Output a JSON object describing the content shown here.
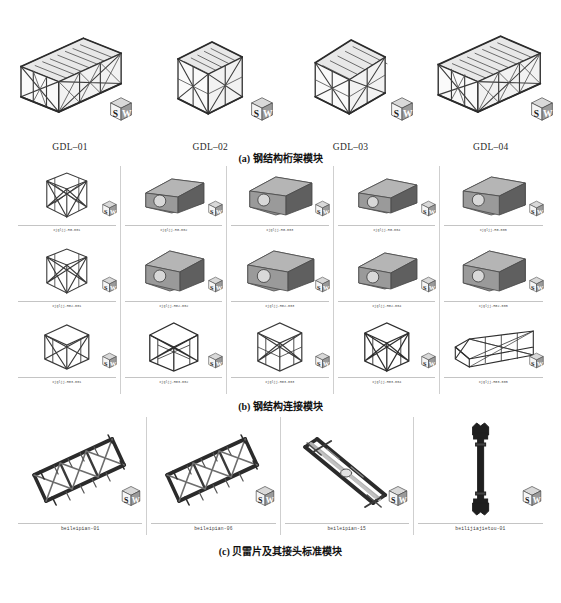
{
  "figure": {
    "sections": [
      {
        "id": "a",
        "caption": "(a) 钢结构桁架模块",
        "items": [
          {
            "label": "GDL–01",
            "shape": "long-truss-box"
          },
          {
            "label": "GDL–02",
            "shape": "square-truss-box"
          },
          {
            "label": "GDL–03",
            "shape": "square-truss-box"
          },
          {
            "label": "GDL–04",
            "shape": "long-truss-box"
          }
        ]
      },
      {
        "id": "b",
        "caption": "(b) 钢结构连接模块",
        "rows": [
          [
            {
              "label": "xjgljj-HG-001",
              "shape": "frame-node"
            },
            {
              "label": "xjgljj-HG-002",
              "shape": "solid-block"
            },
            {
              "label": "xjgljj-HG-003",
              "shape": "solid-block"
            },
            {
              "label": "xjgljj-HG-004",
              "shape": "solid-block"
            },
            {
              "label": "xjgljj-HG-005",
              "shape": "solid-block"
            }
          ],
          [
            {
              "label": "xjgljj-HG2-001",
              "shape": "frame-node"
            },
            {
              "label": "xjgljj-HG2-002",
              "shape": "solid-block"
            },
            {
              "label": "xjgljj-HG2-003",
              "shape": "solid-block"
            },
            {
              "label": "xjgljj-HG2-004",
              "shape": "solid-block"
            },
            {
              "label": "xjgljj-HG2-005",
              "shape": "solid-block"
            }
          ],
          [
            {
              "label": "xjgljj-HG3-001",
              "shape": "frame-cube"
            },
            {
              "label": "xjgljj-HG3-002",
              "shape": "frame-cube"
            },
            {
              "label": "xjgljj-HG3-003",
              "shape": "frame-cube"
            },
            {
              "label": "xjgljj-HG3-004",
              "shape": "frame-cube"
            },
            {
              "label": "xjgljj-HG3-005",
              "shape": "frame-long"
            }
          ]
        ]
      },
      {
        "id": "c",
        "caption": "(c) 贝雷片及其接头标准模块",
        "items": [
          {
            "label": "beileipian-01",
            "shape": "bailey-panel"
          },
          {
            "label": "beileipian-06",
            "shape": "bailey-panel"
          },
          {
            "label": "beileipian-15",
            "shape": "bailey-brace"
          },
          {
            "label": "beilijiajietou-01",
            "shape": "bailey-pin"
          }
        ]
      }
    ]
  },
  "watermark": {
    "name": "solidworks-cube-logo",
    "top_letter": "S",
    "right_letter": "W"
  },
  "colors": {
    "ink": "#2b2b2b",
    "steel_dark": "#3a3a3a",
    "steel_mid": "#6e6e6e",
    "steel_light": "#a8a8a8",
    "block_face": "#8c8c8c",
    "block_top": "#b5b5b5",
    "block_side": "#5f5f5f",
    "rule": "#c4c4c4",
    "bg": "#ffffff"
  }
}
